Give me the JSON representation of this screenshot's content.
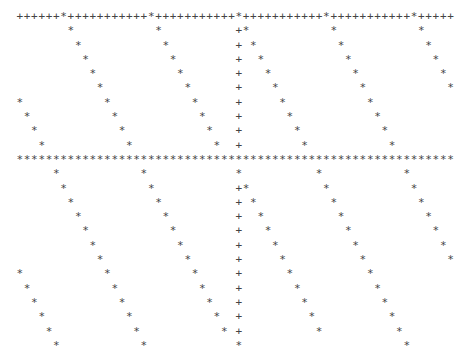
{
  "chart_data": {
    "type": "scatter",
    "style": "line-printer ASCII plot",
    "title": "",
    "xlabel": "",
    "ylabel": "",
    "grid": false,
    "columns": 60,
    "rows": 24,
    "axis_symbols": {
      "border": "+",
      "data": "*"
    },
    "top_border_row": 0,
    "horizontal_axis_row": 10,
    "vertical_axis_col": 30,
    "sawtooth_period_cols": 12,
    "series": [
      {
        "name": "upper-sawtooth",
        "points": [
          [
            0,
            6
          ],
          [
            1,
            7
          ],
          [
            2,
            8
          ],
          [
            3,
            9
          ],
          [
            4,
            10
          ],
          [
            5,
            11
          ],
          [
            6,
            12
          ],
          [
            7,
            13
          ],
          [
            8,
            14
          ],
          [
            9,
            15
          ],
          [
            0,
            18
          ],
          [
            1,
            19
          ],
          [
            2,
            20
          ],
          [
            3,
            21
          ],
          [
            4,
            22
          ],
          [
            5,
            23
          ],
          [
            6,
            24
          ],
          [
            7,
            25
          ],
          [
            8,
            26
          ],
          [
            9,
            27
          ],
          [
            0,
            30
          ],
          [
            1,
            31
          ],
          [
            2,
            32
          ],
          [
            3,
            33
          ],
          [
            4,
            34
          ],
          [
            5,
            35
          ],
          [
            6,
            36
          ],
          [
            7,
            37
          ],
          [
            8,
            38
          ],
          [
            9,
            39
          ],
          [
            0,
            42
          ],
          [
            1,
            43
          ],
          [
            2,
            44
          ],
          [
            3,
            45
          ],
          [
            4,
            46
          ],
          [
            5,
            47
          ],
          [
            6,
            48
          ],
          [
            7,
            49
          ],
          [
            8,
            50
          ],
          [
            9,
            51
          ],
          [
            0,
            54
          ],
          [
            1,
            55
          ],
          [
            2,
            56
          ],
          [
            3,
            57
          ],
          [
            4,
            58
          ],
          [
            5,
            59
          ],
          [
            6,
            0
          ],
          [
            7,
            1
          ],
          [
            8,
            2
          ],
          [
            9,
            3
          ]
        ]
      },
      {
        "name": "lower-sawtooth",
        "points": [
          [
            11,
            5
          ],
          [
            12,
            6
          ],
          [
            13,
            7
          ],
          [
            14,
            8
          ],
          [
            15,
            9
          ],
          [
            16,
            10
          ],
          [
            17,
            11
          ],
          [
            18,
            12
          ],
          [
            19,
            13
          ],
          [
            20,
            14
          ],
          [
            21,
            15
          ],
          [
            22,
            16
          ],
          [
            23,
            17
          ],
          [
            11,
            17
          ],
          [
            12,
            18
          ],
          [
            13,
            19
          ],
          [
            14,
            20
          ],
          [
            15,
            21
          ],
          [
            16,
            22
          ],
          [
            17,
            23
          ],
          [
            18,
            24
          ],
          [
            19,
            25
          ],
          [
            20,
            26
          ],
          [
            21,
            27
          ],
          [
            22,
            28
          ],
          [
            23,
            30
          ],
          [
            11,
            30
          ],
          [
            12,
            31
          ],
          [
            13,
            32
          ],
          [
            14,
            33
          ],
          [
            15,
            34
          ],
          [
            16,
            35
          ],
          [
            17,
            36
          ],
          [
            18,
            37
          ],
          [
            19,
            38
          ],
          [
            20,
            39
          ],
          [
            21,
            40
          ],
          [
            22,
            41
          ],
          [
            11,
            41
          ],
          [
            12,
            42
          ],
          [
            13,
            43
          ],
          [
            14,
            44
          ],
          [
            15,
            45
          ],
          [
            16,
            46
          ],
          [
            17,
            47
          ],
          [
            18,
            48
          ],
          [
            19,
            49
          ],
          [
            20,
            50
          ],
          [
            21,
            51
          ],
          [
            22,
            52
          ],
          [
            23,
            53
          ],
          [
            11,
            53
          ],
          [
            12,
            54
          ],
          [
            13,
            55
          ],
          [
            14,
            56
          ],
          [
            15,
            57
          ],
          [
            16,
            58
          ],
          [
            17,
            59
          ],
          [
            18,
            0
          ],
          [
            19,
            1
          ],
          [
            20,
            2
          ],
          [
            21,
            3
          ],
          [
            22,
            4
          ],
          [
            23,
            5
          ]
        ]
      }
    ]
  }
}
